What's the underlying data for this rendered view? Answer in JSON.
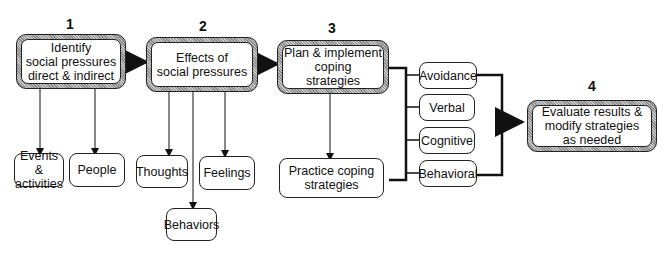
{
  "steps": [
    {
      "number": "1",
      "label": "Identify\nsocial pressures\ndirect & indirect"
    },
    {
      "number": "2",
      "label": "Effects of\nsocial pressures"
    },
    {
      "number": "3",
      "label": "Plan & implement\ncoping\nstrategies"
    },
    {
      "number": "4",
      "label": "Evaluate results &\nmodify strategies\nas needed"
    }
  ],
  "step1_children": [
    "Events &\nactivities",
    "People"
  ],
  "step2_children": [
    "Thoughts",
    "Feelings",
    "Behaviors"
  ],
  "step3_children": [
    "Practice coping\nstrategies"
  ],
  "strategy_types": [
    "Avoidance",
    "Verbal",
    "Cognitive",
    "Behavioral"
  ]
}
